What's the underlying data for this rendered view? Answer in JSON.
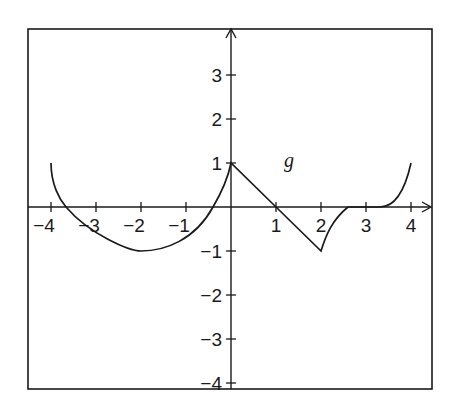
{
  "chart_data": {
    "type": "line",
    "title": "",
    "function_label": "g",
    "xlabel": "",
    "ylabel": "",
    "xlim": [
      -4,
      4
    ],
    "ylim": [
      -4,
      4
    ],
    "grid": false,
    "x_ticks": [
      -4,
      -3,
      -2,
      -1,
      1,
      2,
      3,
      4
    ],
    "x_tick_labels": [
      "−4",
      "−3",
      "−2",
      "−1",
      "1",
      "2",
      "3",
      "4"
    ],
    "y_ticks": [
      3,
      2,
      1,
      -1,
      -2,
      -3,
      -4
    ],
    "y_tick_labels": [
      "3",
      "2",
      "1",
      "−1",
      "−2",
      "−3",
      "−4"
    ],
    "series": [
      {
        "name": "g",
        "segments": [
          {
            "shape": "semicircle-arc",
            "description": "lower curve from (-4,1) through minimum (-2,-1) to (0,1)",
            "points": [
              [
                -4,
                1
              ],
              [
                -3.7,
                0
              ],
              [
                -3,
                -0.7
              ],
              [
                -2,
                -1
              ],
              [
                -1,
                -0.7
              ],
              [
                -0.3,
                0
              ],
              [
                0,
                1
              ]
            ]
          },
          {
            "shape": "line",
            "points": [
              [
                0,
                1
              ],
              [
                1,
                0
              ],
              [
                2,
                -1
              ]
            ]
          },
          {
            "shape": "curve",
            "points": [
              [
                2,
                -1
              ],
              [
                2.2,
                -0.5
              ],
              [
                2.6,
                0
              ]
            ]
          },
          {
            "shape": "line",
            "points": [
              [
                2.6,
                0
              ],
              [
                3.3,
                0
              ]
            ]
          },
          {
            "shape": "curve",
            "points": [
              [
                3.3,
                0
              ],
              [
                3.7,
                0.3
              ],
              [
                4,
                1
              ]
            ]
          }
        ]
      }
    ]
  }
}
